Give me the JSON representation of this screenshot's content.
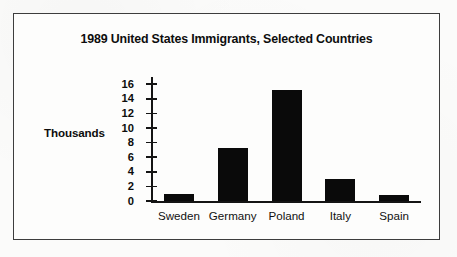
{
  "chart_data": {
    "type": "bar",
    "title": "1989 United States Immigrants, Selected Countries",
    "xlabel": "",
    "ylabel": "Thousands",
    "categories": [
      "Sweden",
      "Germany",
      "Poland",
      "Italy",
      "Spain"
    ],
    "values": [
      0.9,
      7.2,
      15.2,
      3.0,
      0.8
    ],
    "ytick_labels": [
      "16",
      "14",
      "12",
      "10",
      "8",
      "6",
      "4",
      "2",
      "0"
    ],
    "ytick_values": [
      16,
      14,
      12,
      10,
      8,
      6,
      4,
      2,
      0
    ],
    "ylim": [
      0,
      17
    ],
    "grid": false,
    "legend": null,
    "bar_color": "#0a0a0a",
    "axis_color": "#141414",
    "background_color": "#fdfdfc",
    "border_color": "#3d3d3d"
  }
}
